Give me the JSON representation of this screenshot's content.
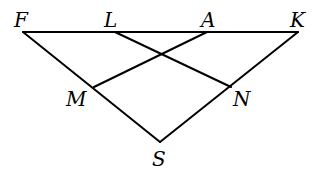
{
  "diagram": {
    "type": "geometry",
    "colors": {
      "stroke": "#000000",
      "background": "#ffffff"
    },
    "points": {
      "F": {
        "label": "F",
        "x": 23,
        "y": 32,
        "lx": 14,
        "ly": 27
      },
      "L": {
        "label": "L",
        "x": 115,
        "y": 32,
        "lx": 104,
        "ly": 27
      },
      "A": {
        "label": "A",
        "x": 207,
        "y": 32,
        "lx": 201,
        "ly": 27
      },
      "K": {
        "label": "K",
        "x": 298,
        "y": 32,
        "lx": 290,
        "ly": 27
      },
      "M": {
        "label": "M",
        "x": 94,
        "y": 87,
        "lx": 66,
        "ly": 106
      },
      "N": {
        "label": "N",
        "x": 231,
        "y": 87,
        "lx": 233,
        "ly": 106
      },
      "S": {
        "label": "S",
        "x": 160,
        "y": 142,
        "lx": 152,
        "ly": 166
      }
    },
    "segments": [
      {
        "from": "F",
        "to": "K"
      },
      {
        "from": "F",
        "to": "S"
      },
      {
        "from": "K",
        "to": "S"
      },
      {
        "from": "L",
        "to": "N"
      },
      {
        "from": "A",
        "to": "M"
      }
    ]
  }
}
